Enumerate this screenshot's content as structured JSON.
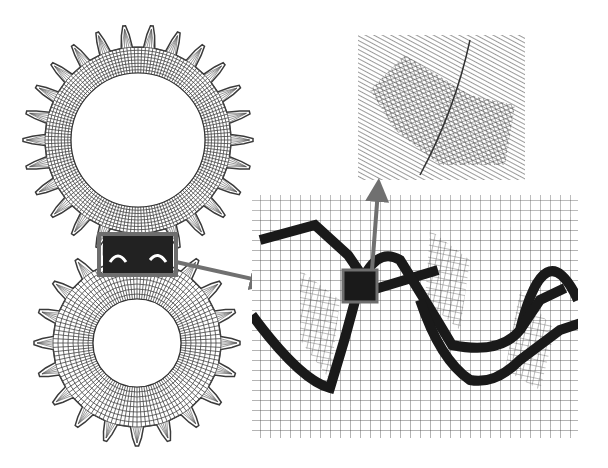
{
  "figure": {
    "colors": {
      "background": "#ffffff",
      "mesh_line": "#3a3a3a",
      "contact_band": "#1a1a1a",
      "highlight_box": "#6e6e6e",
      "arrow": "#707070"
    },
    "upper_gear": {
      "cx": 138,
      "cy": 140,
      "tip_r": 115,
      "root_r": 93,
      "bore_r": 67,
      "teeth": 26
    },
    "lower_gear": {
      "cx": 137,
      "cy": 343,
      "tip_r": 103,
      "root_r": 84,
      "bore_r": 44,
      "teeth": 20
    },
    "mesh_region_box": {
      "x": 99,
      "y": 234,
      "w": 77,
      "h": 41
    },
    "zoom_panel": {
      "x": 252,
      "y": 195,
      "w": 326,
      "h": 243
    },
    "contact_box": {
      "x": 343,
      "y": 270,
      "w": 34,
      "h": 32
    },
    "detail_inset": {
      "x": 358,
      "y": 35,
      "w": 167,
      "h": 145
    }
  }
}
